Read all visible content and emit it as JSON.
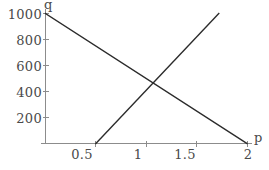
{
  "chart_data": {
    "type": "line",
    "title": "",
    "subtitle": "",
    "xlabel": "p",
    "ylabel": "q",
    "xlim": [
      0,
      2.12
    ],
    "ylim": [
      0,
      1080
    ],
    "grid": false,
    "legend": null,
    "x_ticks": [
      {
        "value": 0.5,
        "label": "0.5"
      },
      {
        "value": 1,
        "label": "1"
      },
      {
        "value": 1.5,
        "label": "1.5"
      },
      {
        "value": 2,
        "label": "2"
      }
    ],
    "y_ticks": [
      {
        "value": 200,
        "label": "200"
      },
      {
        "value": 400,
        "label": "400"
      },
      {
        "value": 600,
        "label": "600"
      },
      {
        "value": 800,
        "label": "800"
      },
      {
        "value": 1000,
        "label": "1000"
      }
    ],
    "series": [
      {
        "name": "demand",
        "color": "#2b2b2b",
        "points": [
          [
            0,
            1000
          ],
          [
            2,
            0
          ]
        ]
      },
      {
        "name": "supply",
        "color": "#2b2b2b",
        "points": [
          [
            0.5,
            0
          ],
          [
            1.72,
            1000
          ]
        ]
      }
    ],
    "intersection": {
      "x": 1,
      "y": 500
    },
    "axis_color": "#8c8c8c",
    "line_color": "#2b2b2b",
    "background": "#ffffff"
  }
}
